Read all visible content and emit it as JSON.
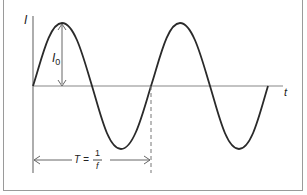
{
  "diagram": {
    "type": "sine-wave",
    "labels": {
      "y_axis": "I",
      "x_axis": "t",
      "amplitude": "I",
      "amplitude_sub": "0",
      "period_lhs": "T =",
      "period_num": "1",
      "period_den": "f"
    },
    "colors": {
      "curve": "#2a2a2a",
      "axis": "#777777",
      "frame": "#9a9a9a",
      "annotation": "#555555"
    }
  }
}
